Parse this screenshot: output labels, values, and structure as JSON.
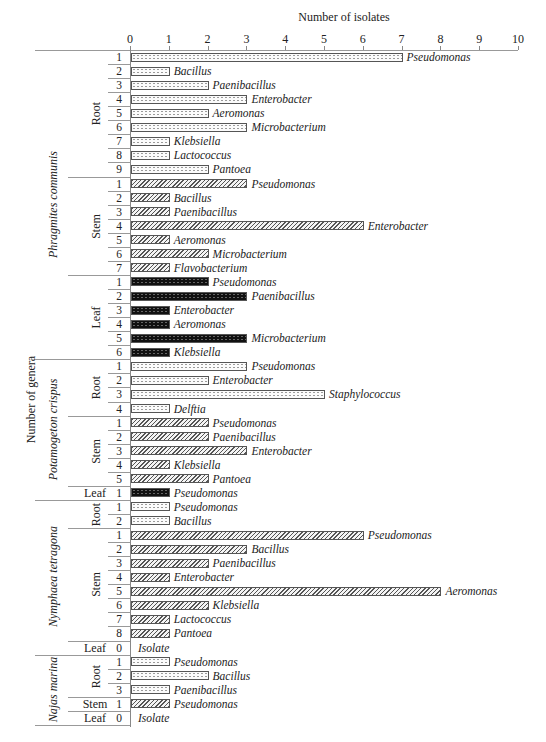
{
  "chart_data": {
    "type": "bar",
    "orientation": "horizontal",
    "title": "",
    "xlabel": "Number of isolates",
    "ylabel": "Number of genera",
    "xlim": [
      0,
      10
    ],
    "x_ticks": [
      "0",
      "1",
      "2",
      "3",
      "4",
      "5",
      "6",
      "7",
      "8",
      "9",
      "10"
    ],
    "grid": false,
    "legend": "none (pattern encodes organ: dotted = Root, hatched = Stem, black = Leaf)",
    "groups": [
      {
        "species": "Phragmites communis",
        "organs": [
          {
            "organ": "Root",
            "pattern": "root",
            "rows": [
              {
                "n": "1",
                "genus": "Pseudomonas",
                "value": 7
              },
              {
                "n": "2",
                "genus": "Bacillus",
                "value": 1
              },
              {
                "n": "3",
                "genus": "Paenibacillus",
                "value": 2
              },
              {
                "n": "4",
                "genus": "Enterobacter",
                "value": 3
              },
              {
                "n": "5",
                "genus": "Aeromonas",
                "value": 2
              },
              {
                "n": "6",
                "genus": "Microbacterium",
                "value": 3
              },
              {
                "n": "7",
                "genus": "Klebsiella",
                "value": 1
              },
              {
                "n": "8",
                "genus": "Lactococcus",
                "value": 1
              },
              {
                "n": "9",
                "genus": "Pantoea",
                "value": 2
              }
            ]
          },
          {
            "organ": "Stem",
            "pattern": "stem",
            "rows": [
              {
                "n": "1",
                "genus": "Pseudomonas",
                "value": 3
              },
              {
                "n": "2",
                "genus": "Bacillus",
                "value": 1
              },
              {
                "n": "3",
                "genus": "Paenibacillus",
                "value": 1
              },
              {
                "n": "4",
                "genus": "Enterobacter",
                "value": 6
              },
              {
                "n": "5",
                "genus": "Aeromonas",
                "value": 1
              },
              {
                "n": "6",
                "genus": "Microbacterium",
                "value": 2
              },
              {
                "n": "7",
                "genus": "Flavobacterium",
                "value": 1
              }
            ]
          },
          {
            "organ": "Leaf",
            "pattern": "leaf",
            "rows": [
              {
                "n": "1",
                "genus": "Pseudomonas",
                "value": 2
              },
              {
                "n": "2",
                "genus": "Paenibacillus",
                "value": 3
              },
              {
                "n": "3",
                "genus": "Enterobacter",
                "value": 1
              },
              {
                "n": "4",
                "genus": "Aeromonas",
                "value": 1
              },
              {
                "n": "5",
                "genus": "Microbacterium",
                "value": 3
              },
              {
                "n": "6",
                "genus": "Klebsiella",
                "value": 1
              }
            ]
          }
        ]
      },
      {
        "species": "Potamogeton crispus",
        "organs": [
          {
            "organ": "Root",
            "pattern": "root",
            "rows": [
              {
                "n": "1",
                "genus": "Pseudomonas",
                "value": 3
              },
              {
                "n": "2",
                "genus": "Enterobacter",
                "value": 2
              },
              {
                "n": "3",
                "genus": "Staphylococcus",
                "value": 5
              },
              {
                "n": "4",
                "genus": "Delftia",
                "value": 1
              }
            ]
          },
          {
            "organ": "Stem",
            "pattern": "stem",
            "rows": [
              {
                "n": "1",
                "genus": "Pseudomonas",
                "value": 2
              },
              {
                "n": "2",
                "genus": "Paenibacillus",
                "value": 2
              },
              {
                "n": "3",
                "genus": "Enterobacter",
                "value": 3
              },
              {
                "n": "4",
                "genus": "Klebsiella",
                "value": 1
              },
              {
                "n": "5",
                "genus": "Pantoea",
                "value": 2
              }
            ]
          },
          {
            "organ": "Leaf",
            "pattern": "leaf",
            "rows": [
              {
                "n": "1",
                "genus": "Pseudomonas",
                "value": 1
              }
            ]
          }
        ]
      },
      {
        "species": "Nymphaea tetragona",
        "organs": [
          {
            "organ": "Root",
            "pattern": "root",
            "rows": [
              {
                "n": "1",
                "genus": "Pseudomonas",
                "value": 1
              },
              {
                "n": "2",
                "genus": "Bacillus",
                "value": 1
              }
            ]
          },
          {
            "organ": "Stem",
            "pattern": "stem",
            "rows": [
              {
                "n": "1",
                "genus": "Pseudomonas",
                "value": 6
              },
              {
                "n": "2",
                "genus": "Bacillus",
                "value": 3
              },
              {
                "n": "3",
                "genus": "Paenibacillus",
                "value": 2
              },
              {
                "n": "4",
                "genus": "Enterobacter",
                "value": 1
              },
              {
                "n": "5",
                "genus": "Aeromonas",
                "value": 8
              },
              {
                "n": "6",
                "genus": "Klebsiella",
                "value": 2
              },
              {
                "n": "7",
                "genus": "Lactococcus",
                "value": 1
              },
              {
                "n": "8",
                "genus": "Pantoea",
                "value": 1
              }
            ]
          },
          {
            "organ": "Leaf",
            "pattern": "leaf",
            "rows": [
              {
                "n": "0",
                "genus": "Isolate",
                "value": 0
              }
            ]
          }
        ]
      },
      {
        "species": "Najas marina",
        "organs": [
          {
            "organ": "Root",
            "pattern": "root",
            "rows": [
              {
                "n": "1",
                "genus": "Pseudomonas",
                "value": 1
              },
              {
                "n": "2",
                "genus": "Bacillus",
                "value": 2
              },
              {
                "n": "3",
                "genus": "Paenibacillus",
                "value": 1
              }
            ]
          },
          {
            "organ": "Stem",
            "pattern": "stem",
            "rows": [
              {
                "n": "1",
                "genus": "Pseudomonas",
                "value": 1
              }
            ]
          },
          {
            "organ": "Leaf",
            "pattern": "leaf",
            "rows": [
              {
                "n": "0",
                "genus": "Isolate",
                "value": 0
              }
            ]
          }
        ]
      }
    ]
  }
}
